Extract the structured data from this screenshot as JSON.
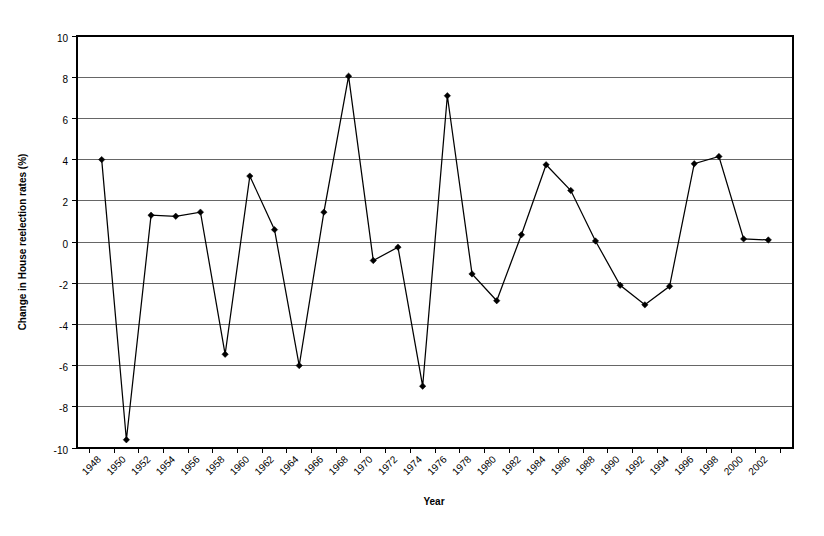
{
  "chart_data": {
    "type": "line",
    "title": "",
    "xlabel": "Year",
    "ylabel": "Change in House reelection rates (%)",
    "xlim": [
      1947,
      2003
    ],
    "ylim": [
      -10,
      10
    ],
    "ytick_step": 2,
    "grid": true,
    "legend": "none",
    "marker": "diamond",
    "line_color": "#000000",
    "marker_color": "#000000",
    "grid_color": "#555555",
    "categories": [
      "1948",
      "1950",
      "1952",
      "1954",
      "1956",
      "1958",
      "1960",
      "1962",
      "1964",
      "1966",
      "1968",
      "1970",
      "1972",
      "1974",
      "1976",
      "1978",
      "1980",
      "1982",
      "1984",
      "1986",
      "1988",
      "1990",
      "1992",
      "1994",
      "1996",
      "1998",
      "2000",
      "2002"
    ],
    "values": [
      4.0,
      -9.6,
      1.3,
      1.25,
      1.45,
      -5.45,
      3.2,
      0.6,
      -6.0,
      1.45,
      8.05,
      -0.9,
      -0.25,
      -7.0,
      7.1,
      -1.55,
      -2.85,
      0.35,
      3.75,
      2.5,
      0.05,
      -2.1,
      -3.05,
      -2.15,
      3.8,
      4.15,
      0.15,
      0.1
    ],
    "yticks": [
      -10,
      -8,
      -6,
      -4,
      -2,
      0,
      2,
      4,
      6,
      8,
      10
    ],
    "ytick_labels": [
      "-10",
      "-8",
      "-6",
      "-4",
      "-2",
      "0",
      "2",
      "4",
      "6",
      "8",
      "10"
    ]
  }
}
